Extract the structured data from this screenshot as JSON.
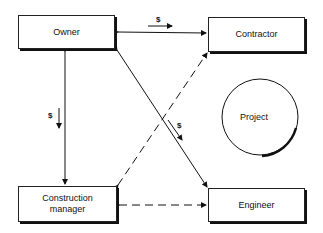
{
  "diagram": {
    "nodes": {
      "owner": "Owner",
      "contractor": "Contractor",
      "construction_manager": "Construction\nmanager",
      "engineer": "Engineer",
      "project": "Project"
    },
    "edges": [
      {
        "from": "owner",
        "to": "contractor",
        "style": "solid",
        "bidirectional": true,
        "label": "$"
      },
      {
        "from": "owner",
        "to": "construction_manager",
        "style": "solid",
        "bidirectional": true,
        "label": "$"
      },
      {
        "from": "owner",
        "to": "engineer",
        "style": "solid",
        "bidirectional": true,
        "label": "$"
      },
      {
        "from": "construction_manager",
        "to": "contractor",
        "style": "dashed",
        "bidirectional": true,
        "label": ""
      },
      {
        "from": "construction_manager",
        "to": "engineer",
        "style": "dashed",
        "bidirectional": true,
        "label": ""
      }
    ],
    "money_symbol": "$"
  }
}
